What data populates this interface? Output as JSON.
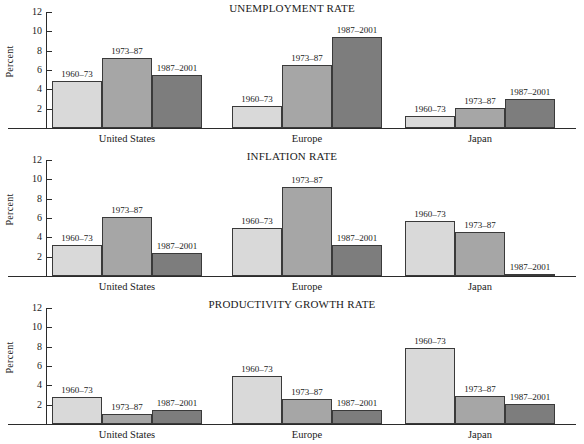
{
  "figure": {
    "ylabel": "Percent",
    "ytick_labels": [
      "12",
      "10",
      "8",
      "6",
      "4",
      "2"
    ],
    "series_labels": [
      "1960–73",
      "1973–87",
      "1987–2001"
    ],
    "group_labels": [
      "United States",
      "Europe",
      "Japan"
    ],
    "colors": {
      "series1": "#d9d9d9",
      "series2": "#a6a6a6",
      "series3": "#7d7d7d",
      "axis": "#2b2b2b",
      "bar_outline": "#3a3a3a",
      "text": "#1a1a1a",
      "background": "#ffffff"
    }
  },
  "chart_data": [
    {
      "type": "bar",
      "title": "UNEMPLOYMENT RATE",
      "xlabel": "",
      "ylabel": "Percent",
      "ylim": [
        0,
        12
      ],
      "yticks": [
        2,
        4,
        6,
        8,
        10,
        12
      ],
      "grid": false,
      "legend": "data labels above bars",
      "categories": [
        "United States",
        "Europe",
        "Japan"
      ],
      "series": [
        {
          "name": "1960–73",
          "values": [
            4.9,
            2.3,
            1.2
          ]
        },
        {
          "name": "1973–87",
          "values": [
            7.2,
            6.5,
            2.1
          ]
        },
        {
          "name": "1987–2001",
          "values": [
            5.5,
            9.4,
            3.0
          ]
        }
      ]
    },
    {
      "type": "bar",
      "title": "INFLATION RATE",
      "xlabel": "",
      "ylabel": "Percent",
      "ylim": [
        0,
        12
      ],
      "yticks": [
        2,
        4,
        6,
        8,
        10,
        12
      ],
      "grid": false,
      "legend": "data labels above bars",
      "categories": [
        "United States",
        "Europe",
        "Japan"
      ],
      "series": [
        {
          "name": "1960–73",
          "values": [
            3.2,
            5.0,
            5.7
          ]
        },
        {
          "name": "1973–87",
          "values": [
            6.1,
            9.2,
            4.6
          ]
        },
        {
          "name": "1987–2001",
          "values": [
            2.4,
            3.2,
            0.2
          ]
        }
      ]
    },
    {
      "type": "bar",
      "title": "PRODUCTIVITY GROWTH RATE",
      "xlabel": "",
      "ylabel": "Percent",
      "ylim": [
        0,
        12
      ],
      "yticks": [
        2,
        4,
        6,
        8,
        10,
        12
      ],
      "grid": false,
      "legend": "data labels above bars",
      "categories": [
        "United States",
        "Europe",
        "Japan"
      ],
      "series": [
        {
          "name": "1960–73",
          "values": [
            2.8,
            5.0,
            7.9
          ]
        },
        {
          "name": "1973–87",
          "values": [
            1.0,
            2.6,
            2.9
          ]
        },
        {
          "name": "1987–2001",
          "values": [
            1.4,
            1.5,
            2.1
          ]
        }
      ]
    }
  ]
}
